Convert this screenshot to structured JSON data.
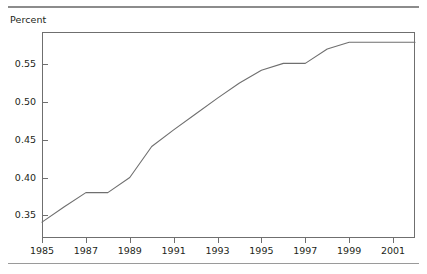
{
  "figure": {
    "axis_title": "Percent",
    "line_color": "#6f6f6f",
    "frame_color": "#6f6f6f",
    "rule_color": "#9a9a9a",
    "text_color": "#231f20"
  },
  "chart_data": {
    "type": "line",
    "title": "",
    "subtitle": "",
    "ylabel": "Percent",
    "xlabel": "",
    "xlim": [
      1985,
      2002
    ],
    "ylim": [
      0.32,
      0.5925
    ],
    "grid": false,
    "legend": null,
    "xticks": [
      1985,
      1987,
      1989,
      1991,
      1993,
      1995,
      1997,
      1999,
      2001
    ],
    "xtick_labels": [
      "1985",
      "1987",
      "1989",
      "1991",
      "1993",
      "1995",
      "1997",
      "1999",
      "2001"
    ],
    "yticks": [
      0.35,
      0.4,
      0.45,
      0.5,
      0.55
    ],
    "ytick_labels": [
      "0.35",
      "0.40",
      "0.45",
      "0.50",
      "0.55"
    ],
    "series": [
      {
        "name": "Percent",
        "x": [
          1985,
          1986,
          1987,
          1988,
          1989,
          1990,
          1991,
          1992,
          1993,
          1994,
          1995,
          1996,
          1997,
          1998,
          1999,
          2000,
          2001,
          2002
        ],
        "values": [
          0.341,
          0.361,
          0.38,
          0.38,
          0.4,
          0.441,
          0.463,
          0.484,
          0.505,
          0.525,
          0.542,
          0.551,
          0.551,
          0.57,
          0.579,
          0.579,
          0.579,
          0.579
        ]
      }
    ]
  }
}
